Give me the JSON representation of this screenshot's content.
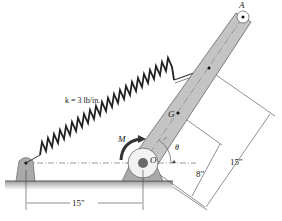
{
  "diagram": {
    "labels": {
      "point_A": "A",
      "point_G": "G",
      "point_O": "O",
      "moment": "M",
      "angle": "θ",
      "spring_constant": "k = 3 lb/in.",
      "dim_horizontal": "15″",
      "dim_OG": "8″",
      "dim_OA_attach": "15″"
    },
    "colors": {
      "bar_fill": "#c4c4c4",
      "support_fill": "#a9a9a9",
      "ground_fill": "#bdbdbd",
      "line": "#333333",
      "hub": "#6a6a6a"
    }
  }
}
